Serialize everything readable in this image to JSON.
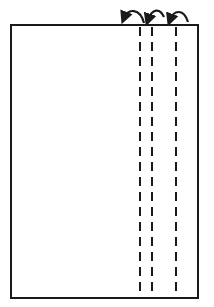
{
  "diagram": {
    "title": "",
    "stroke_color": "#1a1a1a",
    "background": "#ffffff",
    "sheet": {
      "x": 11,
      "y": 25,
      "width": 187,
      "height": 273
    },
    "fold_lines": [
      {
        "x": 140,
        "style": "dashed"
      },
      {
        "x": 152,
        "style": "dashed"
      },
      {
        "x": 176,
        "style": "dashed"
      }
    ],
    "fold_arrows": [
      {
        "from_x": 140,
        "to_x": 122,
        "direction": "left"
      },
      {
        "from_x": 163,
        "to_x": 146,
        "direction": "left"
      },
      {
        "from_x": 189,
        "to_x": 169,
        "direction": "left"
      }
    ]
  }
}
